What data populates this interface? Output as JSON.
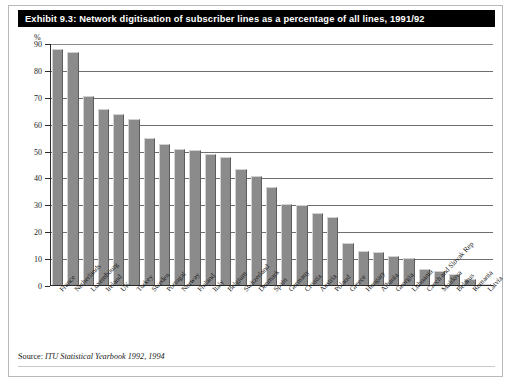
{
  "exhibit": {
    "title": "Exhibit 9.3: Network digitisation of subscriber lines as a percentage of all lines, 1991/92",
    "source_label": "Source:",
    "source_body": "ITU Statistical Yearbook 1992, 1994"
  },
  "chart_data": {
    "type": "bar",
    "title": "Exhibit 9.3: Network digitisation of subscriber lines as a percentage of all lines, 1991/92",
    "xlabel": "",
    "ylabel": "%",
    "ylim": [
      0,
      90
    ],
    "yticks": [
      0,
      10,
      20,
      30,
      40,
      50,
      60,
      70,
      80,
      90
    ],
    "grid": true,
    "legend": false,
    "categories": [
      "France",
      "Netherlands",
      "Luxembourg",
      "Ireland",
      "UK",
      "Turkey",
      "Sweden",
      "Portugal",
      "Norway",
      "Finland",
      "Italy",
      "Belgium",
      "Switzerland",
      "Denmark",
      "Spain",
      "Germany",
      "Croatia",
      "Austria",
      "Poland",
      "Greece",
      "Hungary",
      "Albania",
      "Georgia",
      "Lithuania",
      "Czech and Slovak Rep",
      "Moldova",
      "Belarus",
      "Romania",
      "Latvia"
    ],
    "values": [
      88,
      87,
      70.5,
      66,
      64,
      62,
      55,
      53,
      51,
      50.5,
      49,
      48,
      43.5,
      41,
      37,
      30.5,
      30,
      27,
      25.5,
      16,
      13,
      12.5,
      11,
      10.5,
      6.5,
      5.5,
      4.5,
      2.5,
      0.7
    ],
    "bar_color": "#8b8b8b"
  }
}
